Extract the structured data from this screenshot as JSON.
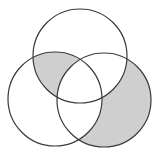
{
  "diagram": {
    "type": "venn",
    "sets": [
      {
        "id": "A",
        "position": "top",
        "cx": 80,
        "cy": 56,
        "r": 47
      },
      {
        "id": "B",
        "position": "bottom-left",
        "cx": 55,
        "cy": 99,
        "r": 47
      },
      {
        "id": "C",
        "position": "bottom-right",
        "cx": 104,
        "cy": 100,
        "r": 47
      }
    ],
    "shaded_regions": [
      "A∩B only (not C)",
      "C only"
    ],
    "colors": {
      "stroke": "#3a3a3a",
      "shade": "#cfcfcf",
      "background": "#ffffff"
    }
  }
}
